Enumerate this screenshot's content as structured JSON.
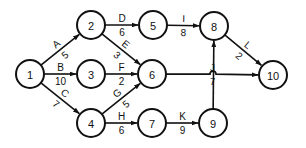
{
  "diagram": {
    "type": "activity-on-arrow network",
    "colors": {
      "stroke": "#111111",
      "fill": "#ffffff"
    },
    "nodes": [
      {
        "id": "1",
        "label": "1",
        "x": 30,
        "y": 74
      },
      {
        "id": "2",
        "label": "2",
        "x": 91,
        "y": 25
      },
      {
        "id": "3",
        "label": "3",
        "x": 91,
        "y": 74
      },
      {
        "id": "4",
        "label": "4",
        "x": 91,
        "y": 123
      },
      {
        "id": "5",
        "label": "5",
        "x": 153,
        "y": 25
      },
      {
        "id": "6",
        "label": "6",
        "x": 152,
        "y": 74
      },
      {
        "id": "7",
        "label": "7",
        "x": 152,
        "y": 123
      },
      {
        "id": "8",
        "label": "8",
        "x": 214,
        "y": 26
      },
      {
        "id": "9",
        "label": "9",
        "x": 213,
        "y": 123
      },
      {
        "id": "10",
        "label": "10",
        "x": 273,
        "y": 75
      }
    ],
    "edges": [
      {
        "activity": "A",
        "duration": "5",
        "from": "1",
        "to": "2"
      },
      {
        "activity": "B",
        "duration": "10",
        "from": "1",
        "to": "3"
      },
      {
        "activity": "C",
        "duration": "7",
        "from": "1",
        "to": "4"
      },
      {
        "activity": "D",
        "duration": "6",
        "from": "2",
        "to": "5"
      },
      {
        "activity": "E",
        "duration": "3",
        "from": "2",
        "to": "6"
      },
      {
        "activity": "F",
        "duration": "2",
        "from": "3",
        "to": "6"
      },
      {
        "activity": "G",
        "duration": "5",
        "from": "4",
        "to": "6"
      },
      {
        "activity": "H",
        "duration": "6",
        "from": "4",
        "to": "7"
      },
      {
        "activity": "I",
        "duration": "8",
        "from": "5",
        "to": "8"
      },
      {
        "activity": "J",
        "duration": "7",
        "from": "6",
        "to": "10"
      },
      {
        "activity": "K",
        "duration": "9",
        "from": "7",
        "to": "9"
      },
      {
        "activity": "L",
        "duration": "2",
        "from": "8",
        "to": "10"
      },
      {
        "activity": "",
        "duration": "",
        "from": "9",
        "to": "8"
      }
    ]
  }
}
